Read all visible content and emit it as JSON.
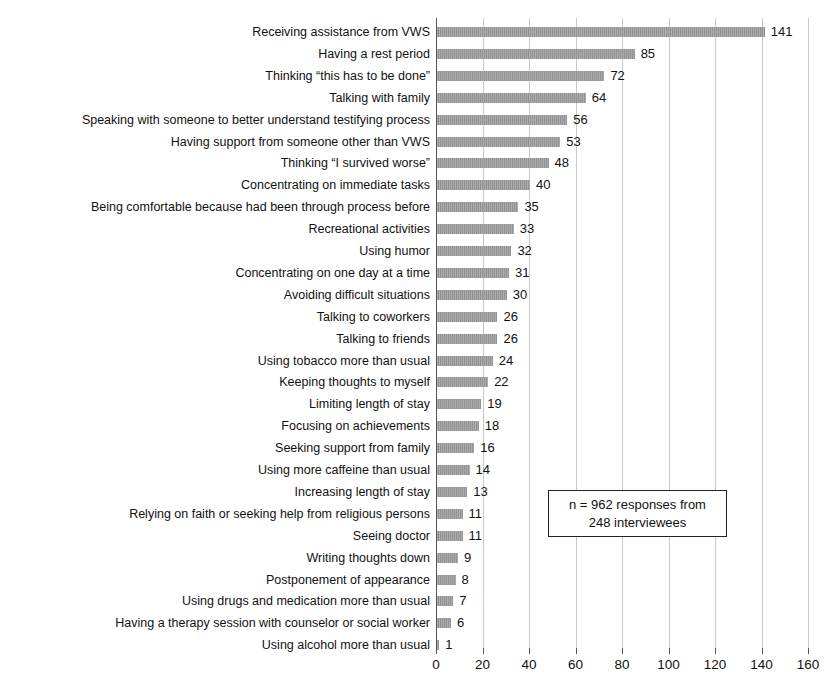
{
  "chart_data": {
    "type": "bar",
    "orientation": "horizontal",
    "title": "",
    "xlabel": "",
    "ylabel": "",
    "xlim": [
      0,
      160
    ],
    "xticks": [
      0,
      20,
      40,
      60,
      80,
      100,
      120,
      140,
      160
    ],
    "grid": true,
    "legend": null,
    "bar_color": "#9a9a9a",
    "categories": [
      "Receiving assistance from VWS",
      "Having a rest period",
      "Thinking “this has to be done”",
      "Talking with family",
      "Speaking with someone to better understand testifying process",
      "Having support from someone other than VWS",
      "Thinking “I survived worse”",
      "Concentrating on immediate tasks",
      "Being comfortable because had been through process before",
      "Recreational activities",
      "Using humor",
      "Concentrating on one day at a time",
      "Avoiding difficult situations",
      "Talking to coworkers",
      "Talking to friends",
      "Using tobacco more than usual",
      "Keeping thoughts to myself",
      "Limiting length of stay",
      "Focusing on achievements",
      "Seeking support from family",
      "Using more caffeine than usual",
      "Increasing length of stay",
      "Relying on faith or seeking help from religious persons",
      "Seeing doctor",
      "Writing thoughts down",
      "Postponement of appearance",
      "Using drugs and medication more than usual",
      "Having a therapy session with counselor or social worker",
      "Using alcohol more than usual"
    ],
    "values": [
      141,
      85,
      72,
      64,
      56,
      53,
      48,
      40,
      35,
      33,
      32,
      31,
      30,
      26,
      26,
      24,
      22,
      19,
      18,
      16,
      14,
      13,
      11,
      11,
      9,
      8,
      7,
      6,
      1
    ],
    "annotation": {
      "line1": "n = 962 responses from",
      "line2": "248 interviewees"
    }
  }
}
